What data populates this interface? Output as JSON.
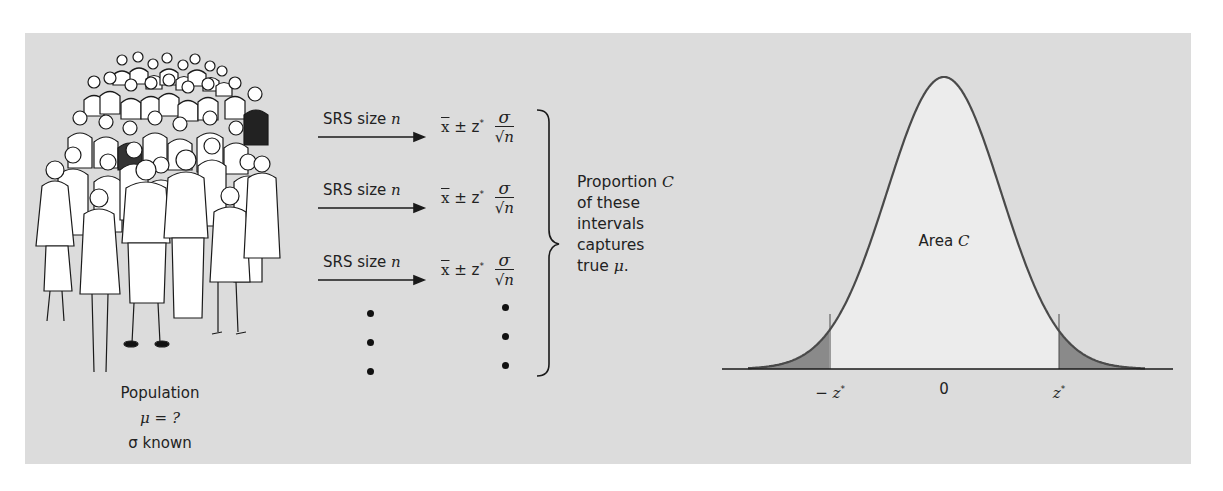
{
  "population": {
    "illustration": "crowd-of-people-illustration",
    "label": "Population",
    "mu_line": "μ = ?",
    "sigma_line": "σ known"
  },
  "samples": [
    {
      "label_prefix": "SRS size ",
      "label_var": "n",
      "formula": {
        "xbar": "x",
        "pm": " ± z",
        "star": "*",
        "numerator": "σ",
        "radical": "√",
        "radicand": "n"
      }
    },
    {
      "label_prefix": "SRS size ",
      "label_var": "n",
      "formula": {
        "xbar": "x",
        "pm": " ± z",
        "star": "*",
        "numerator": "σ",
        "radical": "√",
        "radicand": "n"
      }
    },
    {
      "label_prefix": "SRS size ",
      "label_var": "n",
      "formula": {
        "xbar": "x",
        "pm": " ± z",
        "star": "*",
        "numerator": "σ",
        "radical": "√",
        "radicand": "n"
      }
    }
  ],
  "ellipsis_dots": 3,
  "brace_text": {
    "line1_prefix": "Proportion ",
    "line1_var": "C",
    "line2": "of these",
    "line3": "intervals",
    "line4": "captures",
    "line5_prefix": "true ",
    "line5_var": "μ",
    "line5_suffix": "."
  },
  "normal_curve": {
    "area_label_prefix": "Area ",
    "area_label_var": "C",
    "ticks": [
      {
        "label": "− z",
        "star": "*"
      },
      {
        "label": "0",
        "star": ""
      },
      {
        "label": "z",
        "star": "*"
      }
    ]
  },
  "colors": {
    "background": "#dcdcdc",
    "center_area": "#ececec",
    "tail_area": "#8a8a8a",
    "curve_line": "#4a4a4a"
  }
}
